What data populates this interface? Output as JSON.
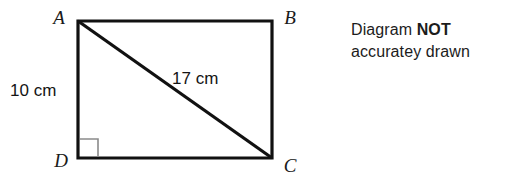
{
  "figure": {
    "type": "geometry-diagram",
    "shape": "rectangle-with-diagonal",
    "vertices": {
      "a": "A",
      "b": "B",
      "c": "C",
      "d": "D"
    },
    "measurements": {
      "side_ad": "10 cm",
      "diagonal_ac": "17 cm"
    },
    "right_angle_at": "D",
    "colors": {
      "outline": "#111111",
      "diagonal": "#111111",
      "right_angle_marker": "#8a8a8a",
      "background": "#ffffff",
      "text": "#1a1a1a"
    }
  },
  "note": {
    "line1_prefix": "Diagram ",
    "line1_emphasis": "NOT",
    "line2": "accuratey drawn"
  }
}
